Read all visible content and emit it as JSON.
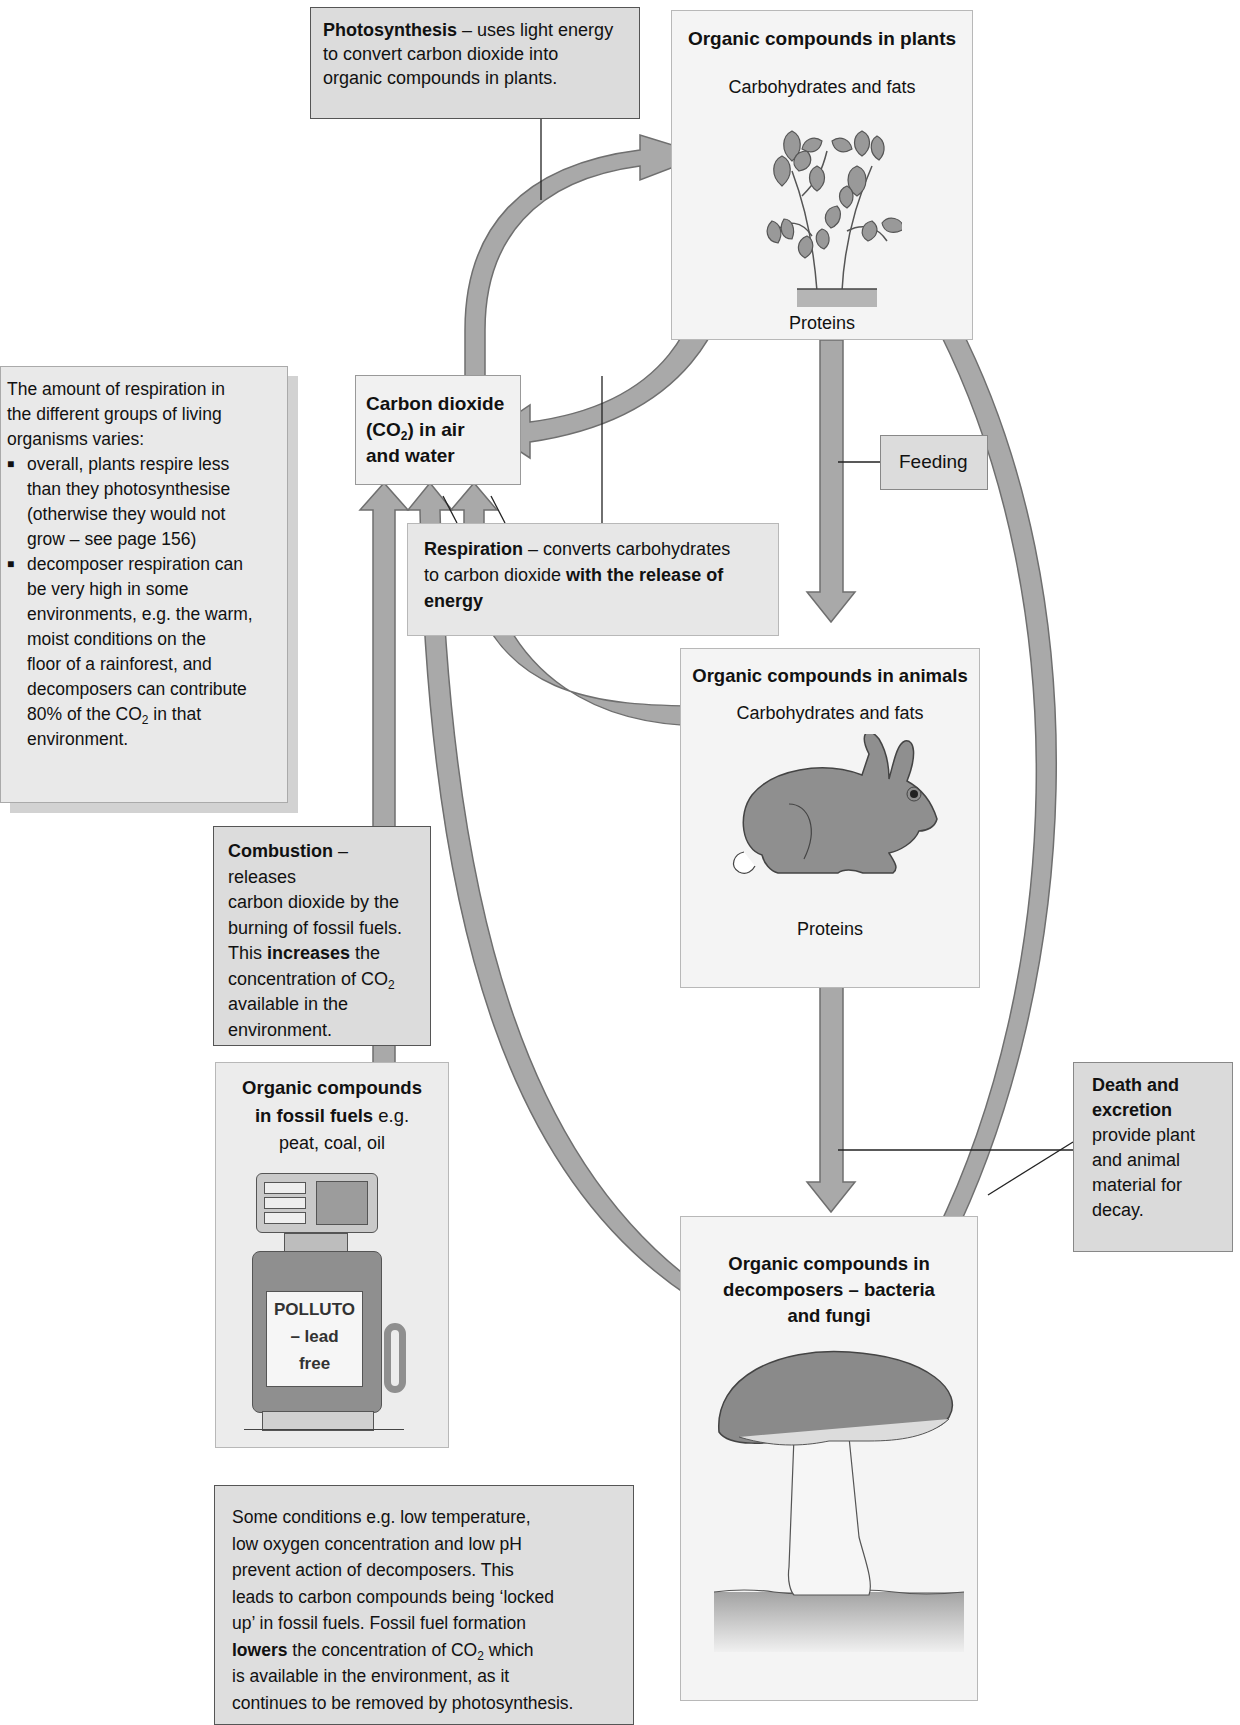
{
  "photosynthesis": {
    "title": "Photosynthesis",
    "text_a": " – uses light energy",
    "text_b": "to convert carbon dioxide into",
    "text_c": "organic compounds in plants."
  },
  "plants": {
    "title": "Organic compounds in plants",
    "carbs": "Carbohydrates and fats",
    "proteins": "Proteins",
    "icon": "plant-icon"
  },
  "co2": {
    "line1": "Carbon dioxide",
    "line2_pre": "(CO",
    "line2_sub": "2",
    "line2_post": ") in air",
    "line3": "and water"
  },
  "respiration_note": {
    "intro_1": "The amount of respiration in",
    "intro_2": "the different groups of living",
    "intro_3": "organisms varies:",
    "bullets": [
      [
        "overall, plants respire less",
        "than they photosynthesise",
        "(otherwise they would not",
        "grow – see page 156)"
      ],
      [
        "decomposer respiration can",
        "be very high in some",
        "environments, e.g. the warm,",
        "moist conditions on the",
        "floor of a rainforest, and",
        "decomposers can contribute"
      ]
    ],
    "last_pre": "80% of the CO",
    "last_sub": "2",
    "last_post": " in that",
    "last_line": "environment."
  },
  "feeding": {
    "label": "Feeding"
  },
  "respiration": {
    "title": "Respiration",
    "text_a": " – converts carbohydrates",
    "text_b": "to carbon dioxide ",
    "text_b_bold": "with the release of",
    "text_c_bold": "energy"
  },
  "animals": {
    "title": "Organic compounds in animals",
    "carbs": "Carbohydrates and fats",
    "proteins": "Proteins",
    "icon": "rabbit-icon"
  },
  "combustion": {
    "title": "Combustion",
    "text_a": " – releases",
    "line2": "carbon dioxide by the",
    "line3": "burning of fossil fuels.",
    "line4_pre": "This ",
    "line4_bold": "increases",
    "line4_post": " the",
    "line5_pre": "concentration of CO",
    "line5_sub": "2",
    "line6": "available in the",
    "line7": "environment."
  },
  "fossil": {
    "title_1": "Organic compounds",
    "title_2_bold": "in fossil fuels",
    "title_2_post": " e.g.",
    "examples": "peat, coal, oil",
    "pump_label_1": "POLLUTO",
    "pump_label_2": "– lead",
    "pump_label_3": "free",
    "icon": "fuel-pump-icon"
  },
  "death": {
    "title_1": "Death and",
    "title_2": "excretion",
    "line3": "provide plant",
    "line4": "and animal",
    "line5": "material for",
    "line6": "decay."
  },
  "decomposers": {
    "title_1": "Organic compounds in",
    "title_2": "decomposers – bacteria",
    "title_3": "and fungi",
    "icon": "mushroom-icon"
  },
  "conditions": {
    "line1": "Some conditions e.g. low temperature,",
    "line2": "low oxygen concentration and low pH",
    "line3": "prevent action of decomposers. This",
    "line4": "leads to carbon compounds being ‘locked",
    "line5": "up’ in fossil fuels. Fossil fuel formation",
    "line6_bold": "lowers",
    "line6_post": " the concentration of CO",
    "line6_sub": "2",
    "line6_end": " which",
    "line7": "is available in the environment, as it",
    "line8": "continues to be removed by photosynthesis."
  },
  "colors": {
    "arrow_fill": "#a9a9a9",
    "arrow_stroke": "#6f6f6f",
    "box_light": "#f1f1f1",
    "box_mid": "#dcdcdc"
  }
}
